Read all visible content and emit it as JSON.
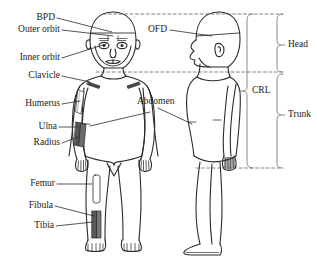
{
  "diagram": {
    "background_color": "#ffffff",
    "stroke_color": "#2b2b2b",
    "text_color": "#1a1a1a",
    "shade_color": "#5a5a5a"
  },
  "labels": {
    "bpd": "BPD",
    "outer_orbit": "Outer orbit",
    "inner_orbit": "Inner orbit",
    "clavicle": "Clavicle",
    "humerus": "Humerus",
    "ulna": "Ulna",
    "radius": "Radius",
    "femur": "Femur",
    "fibula": "Fibula",
    "tibia": "Tibia",
    "ofd": "OFD",
    "abdomen": "Abdomen",
    "head": "Head",
    "crl": "CRL",
    "trunk": "Trunk"
  },
  "figures": [
    {
      "name": "frontal-infant",
      "view": "anterior"
    },
    {
      "name": "profile-infant",
      "view": "lateral"
    }
  ],
  "brackets": [
    {
      "name": "head-bracket",
      "label": "Head"
    },
    {
      "name": "crl-bracket",
      "label": "CRL"
    },
    {
      "name": "trunk-bracket",
      "label": "Trunk"
    }
  ]
}
